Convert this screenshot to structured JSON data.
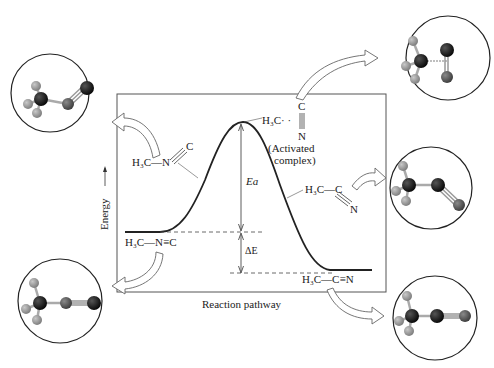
{
  "diagram": {
    "axes": {
      "y_label": "Energy",
      "x_label": "Reaction pathway"
    },
    "labels": {
      "reactant": "H₃C—N≡C",
      "reactant_bent": "H₃C—N",
      "reactant_bent_c": "C",
      "activated_top": "C",
      "activated_left": "H₃C· ·",
      "activated_bottom": "N",
      "activated_caption_1": "(Activated",
      "activated_caption_2": "complex)",
      "product_bent_left": "H₃C—C",
      "product_bent_n": "N",
      "product": "H₃C—C≡N",
      "activation_energy": "Ea",
      "delta_e": "ΔE"
    },
    "molecules": [
      {
        "id": "methyl-isonitrile-bent",
        "position": "top-left"
      },
      {
        "id": "activated-complex",
        "position": "top-right"
      },
      {
        "id": "acetonitrile-bent",
        "position": "middle-right"
      },
      {
        "id": "methyl-isonitrile",
        "position": "bottom-left"
      },
      {
        "id": "acetonitrile",
        "position": "bottom-right"
      }
    ],
    "colors": {
      "carbon": "#111111",
      "nitrogen": "#555555",
      "hydrogen": "#999999",
      "line": "#333333",
      "arrow_fill": "#ffffff",
      "arrow_stroke": "#666666"
    }
  }
}
